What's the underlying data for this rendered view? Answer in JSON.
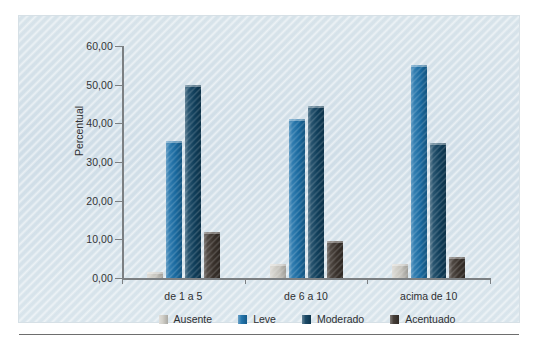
{
  "chart_data": {
    "type": "bar",
    "title": "",
    "xlabel": "",
    "ylabel": "Percentual",
    "categories": [
      "de 1 a 5",
      "de 6 a 10",
      "acima de 10"
    ],
    "ylim": [
      0,
      60
    ],
    "ytick_labels": [
      "0,00",
      "10,00",
      "20,00",
      "30,00",
      "40,00",
      "50,00",
      "60,00"
    ],
    "ytick_values": [
      0,
      10,
      20,
      30,
      40,
      50,
      60
    ],
    "grid": false,
    "legend_position": "bottom",
    "series": [
      {
        "name": "Ausente",
        "color": "#cfcdc6",
        "values": [
          1.5,
          3.5,
          3.5
        ]
      },
      {
        "name": "Leve",
        "color": "#1a6fa8",
        "values": [
          35.5,
          41.0,
          55.0
        ]
      },
      {
        "name": "Moderado",
        "color": "#10415f",
        "values": [
          50.0,
          44.5,
          35.0
        ]
      },
      {
        "name": "Acentuado",
        "color": "#3c342e",
        "values": [
          12.0,
          9.5,
          5.5
        ]
      }
    ]
  },
  "colors": {
    "background": "#d4e1ea",
    "axis": "#7b7f82",
    "text": "#2f3032",
    "rule": "#6e6e6e"
  }
}
